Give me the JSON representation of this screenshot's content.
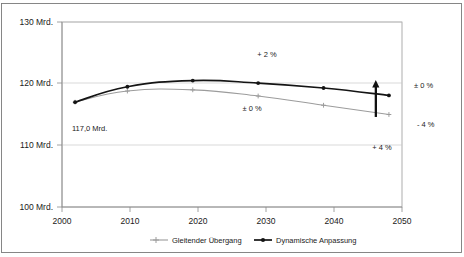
{
  "chart_data": {
    "type": "line",
    "title": "",
    "xlabel": "",
    "ylabel": "",
    "xlim": [
      2000,
      2052
    ],
    "ylim": [
      100,
      130
    ],
    "grid": true,
    "legend_position": "bottom",
    "x_ticks": [
      "2000",
      "2010",
      "2020",
      "2030",
      "2040",
      "2050"
    ],
    "y_ticks": [
      "100 Mrd.",
      "110 Mrd.",
      "120 Mrd.",
      "130 Mrd."
    ],
    "y_tick_values": [
      100,
      110,
      120,
      130
    ],
    "x_tick_values": [
      2000,
      2010,
      2020,
      2030,
      2040,
      2050
    ],
    "series": [
      {
        "name": "Gleitender Übergang",
        "color": "#9c9c9c",
        "x": [
          2002,
          2010,
          2020,
          2030,
          2040,
          2050
        ],
        "values": [
          117.0,
          118.8,
          119.0,
          118.0,
          116.5,
          115.0
        ]
      },
      {
        "name": "Dynamische Anpassung",
        "color": "#141414",
        "x": [
          2002,
          2010,
          2020,
          2030,
          2040,
          2050
        ],
        "values": [
          117.0,
          119.5,
          120.5,
          120.1,
          119.3,
          118.1
        ]
      }
    ],
    "annotations": [
      {
        "id": "start-value",
        "text": "117,0 Mrd.",
        "x": 2002,
        "y": 113.5
      },
      {
        "id": "plus-2-percent",
        "text": "+ 2 %",
        "x": 2031,
        "y": 123.3
      },
      {
        "id": "pm-0-percent-inner",
        "text": "± 0 %",
        "x": 2031,
        "y": 117.6
      },
      {
        "id": "plus-4-percent",
        "text": "+ 4 %",
        "x": 2046,
        "y": 110.9
      },
      {
        "id": "pm-0-percent-right",
        "text": "± 0 %",
        "x": 2053,
        "y": 119.2
      },
      {
        "id": "minus-4-percent-right",
        "text": "- 4 %",
        "x": 2053,
        "y": 114.8
      }
    ],
    "arrow": {
      "id": "range-arrow",
      "x": 2048,
      "y_from": 114.6,
      "y_to": 120.6,
      "direction": "up"
    }
  },
  "legend": {
    "items": [
      {
        "label": "Gleitender Übergang",
        "color": "#9c9c9c",
        "style": "light"
      },
      {
        "label": "Dynamische Anpassung",
        "color": "#141414",
        "style": "dark"
      }
    ]
  }
}
